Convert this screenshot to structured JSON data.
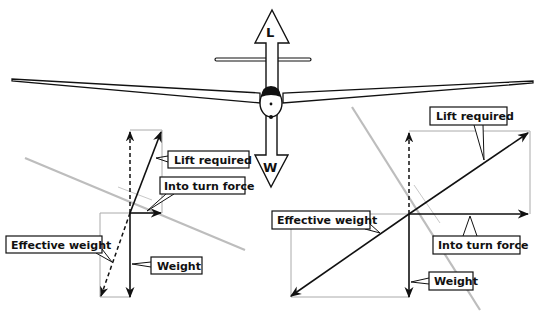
{
  "diagram": {
    "glider": {
      "lift_symbol": "L",
      "weight_symbol": "W"
    },
    "left_panel": {
      "description": "Gentle bank",
      "labels": {
        "lift_required": "Lift required",
        "into_turn_force": "Into turn force",
        "effective_weight": "Effective weight",
        "weight": "Weight"
      }
    },
    "right_panel": {
      "description": "Steep bank",
      "labels": {
        "lift_required": "Lift required",
        "into_turn_force": "Into turn force",
        "effective_weight": "Effective weight",
        "weight": "Weight"
      }
    },
    "colors": {
      "ink": "#111111",
      "wing_gray": "#b8b8b8",
      "box_gray": "#a8a8a8"
    }
  }
}
